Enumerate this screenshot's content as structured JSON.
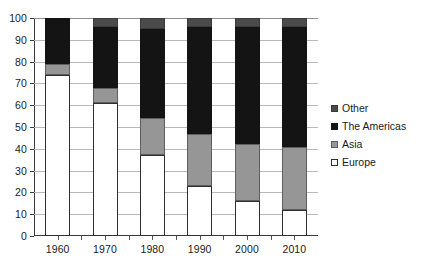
{
  "chart_data": {
    "type": "bar",
    "stacked": true,
    "stack_mode": "percent",
    "title": "",
    "subtitle": "",
    "xlabel": "",
    "ylabel": "",
    "ylim": [
      0,
      100
    ],
    "ytick_step": 10,
    "yticks": [
      0,
      10,
      20,
      30,
      40,
      50,
      60,
      70,
      80,
      90,
      100
    ],
    "categories": [
      "1960",
      "1970",
      "1980",
      "1990",
      "2000",
      "2010"
    ],
    "grid": {
      "horizontal": true,
      "vertical": false
    },
    "legend": {
      "position": "right",
      "entries": [
        "Other",
        "The Americas",
        "Asia",
        "Europe"
      ]
    },
    "series": [
      {
        "name": "Europe",
        "color": "#ffffff",
        "values": [
          74,
          61,
          37,
          23,
          16,
          12
        ]
      },
      {
        "name": "Asia",
        "color": "#969696",
        "values": [
          5,
          7,
          17,
          24,
          26,
          29
        ]
      },
      {
        "name": "The Americas",
        "color": "#141414",
        "values": [
          21,
          28,
          41,
          49,
          54,
          55
        ]
      },
      {
        "name": "Other",
        "color": "#4b4b4b",
        "values": [
          0,
          4,
          5,
          4,
          4,
          4
        ]
      }
    ]
  },
  "legend": {
    "items": [
      {
        "label": "Other",
        "key": "other"
      },
      {
        "label": "The Americas",
        "key": "americas"
      },
      {
        "label": "Asia",
        "key": "asia"
      },
      {
        "label": "Europe",
        "key": "europe"
      }
    ]
  }
}
